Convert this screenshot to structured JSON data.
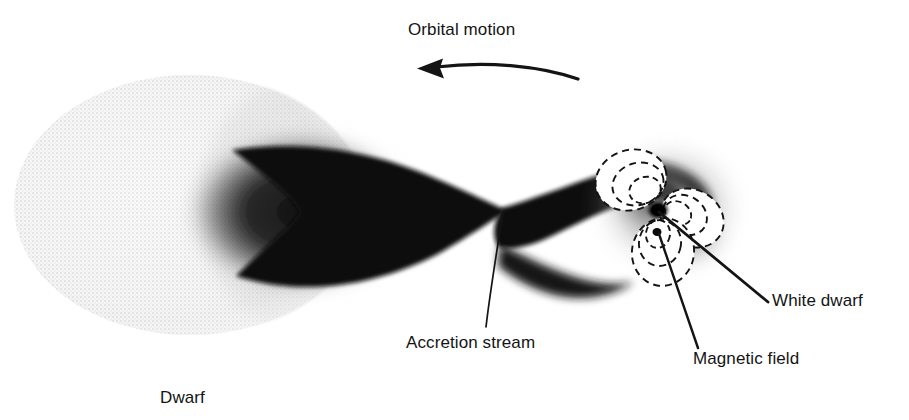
{
  "figure": {
    "type": "astronomy-diagram",
    "background_color": "#ffffff",
    "ink_color": "#141414"
  },
  "labels": {
    "orbital_motion": "Orbital motion",
    "accretion_stream": "Accretion stream",
    "magnetic_field": "Magnetic field",
    "white_dwarf": "White dwarf",
    "dwarf": "Dwarf"
  },
  "icons": {
    "orbital_arrow": "curved-arrow-left-icon",
    "donor_star": "stippled-star-icon",
    "stream": "accretion-stream-icon",
    "field_loops": "magnetic-field-loops-icon",
    "compact_object": "white-dwarf-core-icon"
  },
  "colors": {
    "ink": "#141414",
    "stream_dark": "#0e0e0e",
    "donor_light": "#e9e9e9",
    "halo_mid": "#9a9a9a",
    "paper": "#ffffff"
  },
  "geometry": {
    "donor_center": [
      190,
      205
    ],
    "donor_radius": [
      175,
      128
    ],
    "l1_point": [
      505,
      212
    ],
    "white_dwarf_center": [
      658,
      210
    ],
    "arrow_tip": [
      418,
      68
    ],
    "arrow_tail": [
      578,
      79
    ]
  },
  "field_lobes": [
    {
      "name": "upper-left-lobe",
      "loops": 3
    },
    {
      "name": "right-lobe",
      "loops": 3
    },
    {
      "name": "lower-lobe",
      "loops": 3
    }
  ]
}
